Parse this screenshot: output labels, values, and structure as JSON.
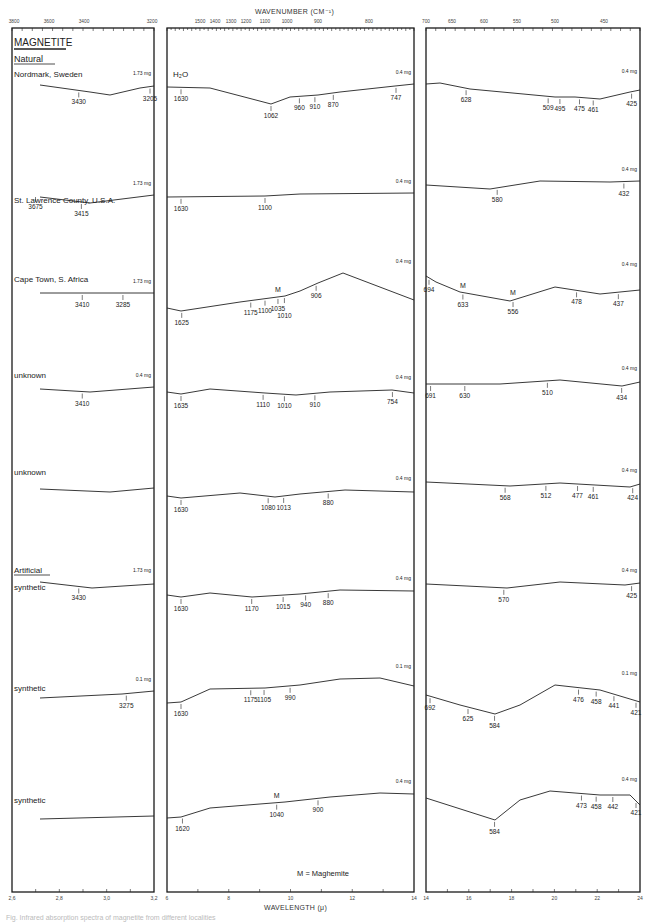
{
  "chart_data": {
    "type": "line",
    "title": "MAGNETITE",
    "subtitle": "Infrared absorption spectra of magnetite samples",
    "x_axis_top": {
      "label": "WAVENUMBER (CM⁻¹)",
      "panels": [
        {
          "ticks": [
            "3800",
            "3600",
            "3400",
            "3200"
          ]
        },
        {
          "ticks": [
            "1500",
            "1400",
            "1300",
            "1200",
            "1100",
            "1000",
            "900",
            "800"
          ]
        },
        {
          "ticks": [
            "700",
            "650",
            "600",
            "550",
            "500",
            "450"
          ]
        }
      ]
    },
    "x_axis_bottom": {
      "label": "WAVELENGTH (μ)",
      "panels": [
        {
          "ticks": [
            "2,6",
            "2,8",
            "3,0",
            "3,2"
          ]
        },
        {
          "ticks": [
            "6",
            "8",
            "10",
            "12",
            "14"
          ]
        },
        {
          "ticks": [
            "14",
            "16",
            "18",
            "20",
            "22",
            "24"
          ]
        }
      ]
    },
    "groups": [
      {
        "label": "Natural",
        "start_index": 0
      },
      {
        "label": "Artificial",
        "start_index": 5
      }
    ],
    "series": [
      {
        "name": "Nordmark, Sweden",
        "panel1": {
          "mass": "1.73 mg",
          "bands": [
            3430,
            3205
          ]
        },
        "panel2": {
          "mass": "0.4 mg",
          "note": "H₂O",
          "bands": [
            1630,
            1062,
            960,
            910,
            870,
            747
          ]
        },
        "panel3": {
          "mass": "0.4 mg",
          "bands": [
            628,
            509,
            495,
            475,
            461,
            425
          ]
        }
      },
      {
        "name": "St. Lawrence County, U.S.A.",
        "panel1": {
          "mass": "1.73 mg",
          "bands": [
            3675,
            3415
          ]
        },
        "panel2": {
          "mass": "0.4 mg",
          "bands": [
            1630,
            1100
          ]
        },
        "panel3": {
          "mass": "0.4 mg",
          "bands": [
            580,
            432
          ]
        }
      },
      {
        "name": "Cape Town, S. Africa",
        "panel1": {
          "mass": "1.73 mg",
          "bands": [
            3410,
            3285
          ]
        },
        "panel2": {
          "mass": "0.4 mg",
          "bands": [
            1625,
            1175,
            1100,
            1035,
            1010,
            906
          ],
          "maghemite_bands": [
            1035
          ]
        },
        "panel3": {
          "mass": "0.4 mg",
          "bands": [
            694,
            633,
            556,
            478,
            437
          ],
          "maghemite_bands": [
            633,
            556
          ]
        }
      },
      {
        "name": "unknown",
        "panel1": {
          "mass": "0.4 mg",
          "bands": [
            3410
          ]
        },
        "panel2": {
          "mass": "0.4 mg",
          "bands": [
            1635,
            1110,
            1010,
            910,
            754
          ]
        },
        "panel3": {
          "mass": "0.4 mg",
          "bands": [
            691,
            630,
            510,
            434
          ]
        }
      },
      {
        "name": "unknown",
        "panel1": {
          "mass": "",
          "bands": []
        },
        "panel2": {
          "mass": "0.4 mg",
          "bands": [
            1630,
            1080,
            1013,
            880
          ]
        },
        "panel3": {
          "mass": "0.4 mg",
          "bands": [
            568,
            512,
            477,
            461,
            424
          ]
        }
      },
      {
        "name": "synthetic",
        "panel1": {
          "mass": "1.73 mg",
          "bands": [
            3430
          ]
        },
        "panel2": {
          "mass": "0.4 mg",
          "bands": [
            1630,
            1170,
            1015,
            940,
            880
          ]
        },
        "panel3": {
          "mass": "0.4 mg",
          "bands": [
            570,
            425
          ]
        }
      },
      {
        "name": "synthetic",
        "panel1": {
          "mass": "0.1 mg",
          "bands": [
            3275
          ]
        },
        "panel2": {
          "mass": "0.1 mg",
          "bands": [
            1630,
            1175,
            1105,
            990
          ]
        },
        "panel3": {
          "mass": "0.1 mg",
          "bands": [
            692,
            625,
            584,
            476,
            458,
            441,
            421
          ]
        }
      },
      {
        "name": "synthetic",
        "panel1": {
          "mass": "",
          "bands": []
        },
        "panel2": {
          "mass": "0.4 mg",
          "bands": [
            1620,
            1040,
            900
          ],
          "maghemite_bands": [
            1040
          ]
        },
        "panel3": {
          "mass": "0.4 mg",
          "bands": [
            584,
            473,
            458,
            442,
            421
          ]
        }
      }
    ],
    "annotations": [
      "M = Maghemite"
    ],
    "legend_position": "none",
    "grid": false
  },
  "labels": {
    "title": "MAGNETITE",
    "natural": "Natural",
    "artificial": "Artificial",
    "wavenumber": "WAVENUMBER (CM⁻¹)",
    "wavelength": "WAVELENGTH (μ)",
    "legend_m": "M = Maghemite",
    "h2o": "H₂O",
    "m": "M",
    "caption": "Fig. Infrared absorption spectra of magnetite from different localities"
  },
  "colors": {
    "ink": "#222222",
    "frame": "#1a1a1a",
    "faint": "#bbbbbb"
  }
}
